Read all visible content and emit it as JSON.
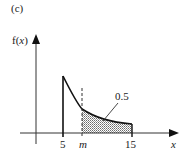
{
  "figure": {
    "panel_label": "(c)",
    "y_axis_label_prefix": "f(",
    "y_axis_label_var": "x",
    "y_axis_label_suffix": ")",
    "x_axis_label": "x",
    "x_ticks": [
      {
        "label": "5",
        "value": 5
      },
      {
        "label": "m",
        "value": "m"
      },
      {
        "label": "15",
        "value": 15
      }
    ],
    "shaded_area_label": "0.5"
  },
  "colors": {
    "line": "#1a1a1a",
    "shade": "#bdbdbd",
    "background": "#ffffff"
  }
}
